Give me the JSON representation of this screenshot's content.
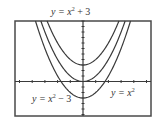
{
  "chart_data": {
    "type": "line",
    "title": "",
    "xlabel": "",
    "ylabel": "",
    "grid": false,
    "legend": "inline labels",
    "xlim": [
      -5.35,
      5.35
    ],
    "ylim": [
      -6.3,
      11
    ],
    "x_tick_step": 1,
    "y_tick_step": 1,
    "series": [
      {
        "name": "y = x^2 + 3",
        "formula": "x^2+3",
        "shift": 3,
        "vertex": [
          0,
          3
        ]
      },
      {
        "name": "y = x^2",
        "formula": "x^2",
        "shift": 0,
        "vertex": [
          0,
          0
        ]
      },
      {
        "name": "y = x^2 - 3",
        "formula": "x^2-3",
        "shift": -3,
        "vertex": [
          0,
          -3
        ]
      }
    ]
  },
  "labels": {
    "top": {
      "base": "y = x",
      "exp": "2",
      "tail": " + 3"
    },
    "right": {
      "base": "y = x",
      "exp": "2",
      "tail": ""
    },
    "left": {
      "base": "y = x",
      "exp": "2",
      "tail": " − 3"
    }
  },
  "colors": {
    "curve": "#3a3a3a",
    "frame": "#4a4a4a",
    "axis": "#3a3a3a"
  }
}
